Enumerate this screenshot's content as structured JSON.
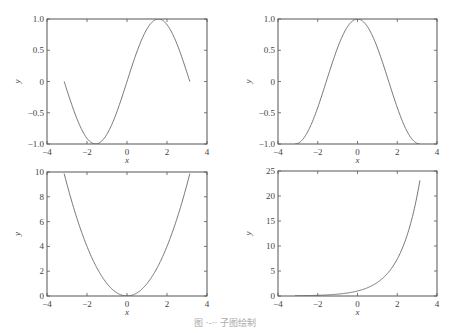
{
  "caption": "图 ·-·· 子图绘制",
  "chart_data": [
    {
      "type": "line",
      "title": "",
      "function": "y = sin(x)",
      "xlabel": "x",
      "ylabel": "y",
      "xlim": [
        -4,
        4
      ],
      "ylim": [
        -1,
        1
      ],
      "xticks": [
        -4,
        -2,
        0,
        2,
        4
      ],
      "yticks": [
        -1.0,
        -0.5,
        0,
        0.5,
        1.0
      ],
      "xtick_labels": [
        "−4",
        "−2",
        "0",
        "2",
        "4"
      ],
      "ytick_labels": [
        "−1.0",
        "−0.5",
        "0",
        "0.5",
        "1.0"
      ],
      "x_range": [
        -3.1416,
        3.1416
      ],
      "grid": false,
      "box": {
        "left": 47,
        "top": 19,
        "right": 207,
        "bottom": 144
      }
    },
    {
      "type": "line",
      "title": "",
      "function": "y = cos(x)",
      "xlabel": "x",
      "ylabel": "y",
      "xlim": [
        -4,
        4
      ],
      "ylim": [
        -1,
        1
      ],
      "xticks": [
        -4,
        -2,
        0,
        2,
        4
      ],
      "yticks": [
        -1.0,
        -0.5,
        0,
        0.5,
        1.0
      ],
      "xtick_labels": [
        "−4",
        "−2",
        "0",
        "2",
        "4"
      ],
      "ytick_labels": [
        "−1.0",
        "−0.5",
        "0",
        "0.5",
        "1.0"
      ],
      "x_range": [
        -3.1416,
        3.1416
      ],
      "grid": false,
      "box": {
        "left": 278,
        "top": 19,
        "right": 437,
        "bottom": 144
      }
    },
    {
      "type": "line",
      "title": "",
      "function": "y = x^2",
      "xlabel": "x",
      "ylabel": "y",
      "xlim": [
        -4,
        4
      ],
      "ylim": [
        0,
        10
      ],
      "xticks": [
        -4,
        -2,
        0,
        2,
        4
      ],
      "yticks": [
        0,
        2,
        4,
        6,
        8,
        10
      ],
      "xtick_labels": [
        "−4",
        "−2",
        "0",
        "2",
        "4"
      ],
      "ytick_labels": [
        "0",
        "2",
        "4",
        "6",
        "8",
        "10"
      ],
      "x_range": [
        -3.1416,
        3.1416
      ],
      "grid": false,
      "box": {
        "left": 47,
        "top": 172,
        "right": 207,
        "bottom": 296
      }
    },
    {
      "type": "line",
      "title": "",
      "function": "y = exp(x)",
      "xlabel": "x",
      "ylabel": "y",
      "xlim": [
        -4,
        4
      ],
      "ylim": [
        0,
        25
      ],
      "xticks": [
        -4,
        -2,
        0,
        2,
        4
      ],
      "yticks": [
        0,
        5,
        10,
        15,
        20,
        25
      ],
      "xtick_labels": [
        "−4",
        "−2",
        "0",
        "2",
        "4"
      ],
      "ytick_labels": [
        "0",
        "5",
        "10",
        "15",
        "20",
        "25"
      ],
      "x_range": [
        -3.1416,
        3.1416
      ],
      "grid": false,
      "box": {
        "left": 278,
        "top": 171,
        "right": 437,
        "bottom": 296
      }
    }
  ],
  "colors": {
    "axes": "#555555",
    "curve": "#666666",
    "text": "#444444"
  }
}
